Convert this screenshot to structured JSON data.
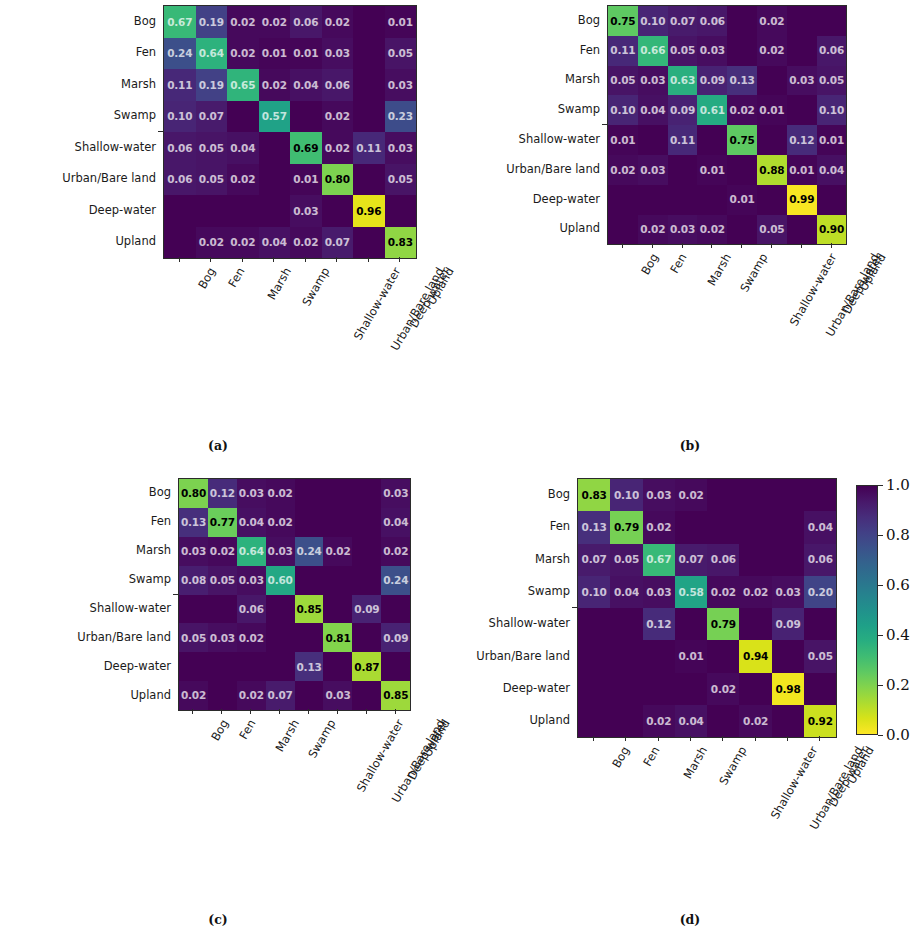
{
  "figure": {
    "classes": [
      "Bog",
      "Fen",
      "Marsh",
      "Swamp",
      "Shallow-water",
      "Urban/Bare land",
      "Deep-water",
      "Upland"
    ],
    "captions": {
      "a": "(a)",
      "b": "(b)",
      "c": "(c)",
      "d": "(d)"
    },
    "colormap": "viridis",
    "colorbar": {
      "vmin": 0.0,
      "vmax": 1.0,
      "ticks": [
        "1.0",
        "0.8",
        "0.6",
        "0.4",
        "0.2",
        "0.0"
      ],
      "tick_values": [
        1.0,
        0.8,
        0.6,
        0.4,
        0.2,
        0.0
      ]
    }
  },
  "chart_data": [
    {
      "type": "heatmap",
      "title": "(a)",
      "xlabel": "",
      "ylabel": "",
      "x_tick_labels": [
        "Bog",
        "Fen",
        "Marsh",
        "Swamp",
        "Shallow-water",
        "Urban/Bare land",
        "Deep-water",
        "Upland"
      ],
      "y_tick_labels": [
        "Bog",
        "Fen",
        "Marsh",
        "Swamp",
        "Shallow-water",
        "Urban/Bare land",
        "Deep-water",
        "Upland"
      ],
      "zlim": [
        0.0,
        1.0
      ],
      "colormap": "viridis",
      "grid": false,
      "legend": "colorbar-right",
      "values": [
        [
          0.67,
          0.19,
          0.02,
          0.02,
          0.06,
          0.02,
          0.0,
          0.01
        ],
        [
          0.24,
          0.64,
          0.02,
          0.01,
          0.01,
          0.03,
          0.0,
          0.05
        ],
        [
          0.11,
          0.19,
          0.65,
          0.02,
          0.04,
          0.06,
          0.0,
          0.03
        ],
        [
          0.1,
          0.07,
          0.0,
          0.57,
          0.0,
          0.02,
          0.0,
          0.23
        ],
        [
          0.06,
          0.05,
          0.04,
          0.0,
          0.69,
          0.02,
          0.11,
          0.03
        ],
        [
          0.06,
          0.05,
          0.02,
          0.0,
          0.01,
          0.8,
          0.0,
          0.05
        ],
        [
          0.0,
          0.0,
          0.0,
          0.0,
          0.03,
          0.0,
          0.96,
          0.0
        ],
        [
          0.0,
          0.02,
          0.02,
          0.04,
          0.02,
          0.07,
          0.0,
          0.83
        ]
      ],
      "labels": [
        [
          "0.67",
          "0.19",
          "0.02",
          "0.02",
          "0.06",
          "0.02",
          "",
          "0.01"
        ],
        [
          "0.24",
          "0.64",
          "0.02",
          "0.01",
          "0.01",
          "0.03",
          "",
          "0.05"
        ],
        [
          "0.11",
          "0.19",
          "0.65",
          "0.02",
          "0.04",
          "0.06",
          "",
          "0.03"
        ],
        [
          "0.10",
          "0.07",
          "",
          "0.57",
          "",
          "0.02",
          "",
          "0.23"
        ],
        [
          "0.06",
          "0.05",
          "0.04",
          "",
          "0.69",
          "0.02",
          "0.11",
          "0.03"
        ],
        [
          "0.06",
          "0.05",
          "0.02",
          "",
          "0.01",
          "0.80",
          "",
          "0.05"
        ],
        [
          "",
          "",
          "",
          "",
          "0.03",
          "",
          "0.96",
          ""
        ],
        [
          "",
          "0.02",
          "0.02",
          "0.04",
          "0.02",
          "0.07",
          "",
          "0.83"
        ]
      ]
    },
    {
      "type": "heatmap",
      "title": "(b)",
      "xlabel": "",
      "ylabel": "",
      "x_tick_labels": [
        "Bog",
        "Fen",
        "Marsh",
        "Swamp",
        "Shallow-water",
        "Urban/Bare land",
        "Deep-water",
        "Upland"
      ],
      "y_tick_labels": [
        "Bog",
        "Fen",
        "Marsh",
        "Swamp",
        "Shallow-water",
        "Urban/Bare land",
        "Deep-water",
        "Upland"
      ],
      "zlim": [
        0.0,
        1.0
      ],
      "colormap": "viridis",
      "grid": false,
      "legend": "colorbar-right",
      "values": [
        [
          0.75,
          0.1,
          0.07,
          0.06,
          0.0,
          0.02,
          0.0,
          0.0
        ],
        [
          0.11,
          0.66,
          0.05,
          0.03,
          0.0,
          0.02,
          0.0,
          0.06
        ],
        [
          0.05,
          0.03,
          0.63,
          0.09,
          0.13,
          0.0,
          0.03,
          0.05
        ],
        [
          0.1,
          0.04,
          0.09,
          0.61,
          0.02,
          0.01,
          0.0,
          0.1
        ],
        [
          0.01,
          0.0,
          0.11,
          0.0,
          0.75,
          0.0,
          0.12,
          0.01
        ],
        [
          0.02,
          0.03,
          0.0,
          0.01,
          0.0,
          0.88,
          0.01,
          0.04
        ],
        [
          0.0,
          0.0,
          0.0,
          0.0,
          0.01,
          0.0,
          0.99,
          0.0
        ],
        [
          0.0,
          0.02,
          0.03,
          0.02,
          0.0,
          0.05,
          0.0,
          0.9
        ]
      ],
      "labels": [
        [
          "0.75",
          "0.10",
          "0.07",
          "0.06",
          "",
          "0.02",
          "",
          ""
        ],
        [
          "0.11",
          "0.66",
          "0.05",
          "0.03",
          "",
          "0.02",
          "",
          "0.06"
        ],
        [
          "0.05",
          "0.03",
          "0.63",
          "0.09",
          "0.13",
          "",
          "0.03",
          "0.05"
        ],
        [
          "0.10",
          "0.04",
          "0.09",
          "0.61",
          "0.02",
          "0.01",
          "",
          "0.10"
        ],
        [
          "0.01",
          "",
          "0.11",
          "",
          "0.75",
          "",
          "0.12",
          "0.01"
        ],
        [
          "0.02",
          "0.03",
          "",
          "0.01",
          "",
          "0.88",
          "0.01",
          "0.04"
        ],
        [
          "",
          "",
          "",
          "",
          "0.01",
          "",
          "0.99",
          ""
        ],
        [
          "",
          "0.02",
          "0.03",
          "0.02",
          "",
          "0.05",
          "",
          "0.90"
        ]
      ]
    },
    {
      "type": "heatmap",
      "title": "(c)",
      "xlabel": "",
      "ylabel": "",
      "x_tick_labels": [
        "Bog",
        "Fen",
        "Marsh",
        "Swamp",
        "Shallow-water",
        "Urban/Bare land",
        "Deep-water",
        "Upland"
      ],
      "y_tick_labels": [
        "Bog",
        "Fen",
        "Marsh",
        "Swamp",
        "Shallow-water",
        "Urban/Bare land",
        "Deep-water",
        "Upland"
      ],
      "zlim": [
        0.0,
        1.0
      ],
      "colormap": "viridis",
      "grid": false,
      "legend": "colorbar-right",
      "values": [
        [
          0.8,
          0.12,
          0.03,
          0.02,
          0.0,
          0.0,
          0.0,
          0.03
        ],
        [
          0.13,
          0.77,
          0.04,
          0.02,
          0.0,
          0.0,
          0.0,
          0.04
        ],
        [
          0.03,
          0.02,
          0.64,
          0.03,
          0.24,
          0.02,
          0.0,
          0.02
        ],
        [
          0.08,
          0.05,
          0.03,
          0.6,
          0.0,
          0.0,
          0.0,
          0.24
        ],
        [
          0.0,
          0.0,
          0.06,
          0.0,
          0.85,
          0.0,
          0.09,
          0.0
        ],
        [
          0.05,
          0.03,
          0.02,
          0.0,
          0.0,
          0.81,
          0.0,
          0.09
        ],
        [
          0.0,
          0.0,
          0.0,
          0.0,
          0.13,
          0.0,
          0.87,
          0.0
        ],
        [
          0.02,
          0.0,
          0.02,
          0.07,
          0.0,
          0.03,
          0.0,
          0.85
        ]
      ],
      "labels": [
        [
          "0.80",
          "0.12",
          "0.03",
          "0.02",
          "",
          "",
          "",
          "0.03"
        ],
        [
          "0.13",
          "0.77",
          "0.04",
          "0.02",
          "",
          "",
          "",
          "0.04"
        ],
        [
          "0.03",
          "0.02",
          "0.64",
          "0.03",
          "0.24",
          "0.02",
          "",
          "0.02"
        ],
        [
          "0.08",
          "0.05",
          "0.03",
          "0.60",
          "",
          "",
          "",
          "0.24"
        ],
        [
          "",
          "",
          "0.06",
          "",
          "0.85",
          "",
          "0.09",
          ""
        ],
        [
          "0.05",
          "0.03",
          "0.02",
          "",
          "",
          "0.81",
          "",
          "0.09"
        ],
        [
          "",
          "",
          "",
          "",
          "0.13",
          "",
          "0.87",
          ""
        ],
        [
          "0.02",
          "",
          "0.02",
          "0.07",
          "",
          "0.03",
          "",
          "0.85"
        ]
      ]
    },
    {
      "type": "heatmap",
      "title": "(d)",
      "xlabel": "",
      "ylabel": "",
      "x_tick_labels": [
        "Bog",
        "Fen",
        "Marsh",
        "Swamp",
        "Shallow-water",
        "Urban/Bare land",
        "Deep-water",
        "Upland"
      ],
      "y_tick_labels": [
        "Bog",
        "Fen",
        "Marsh",
        "Swamp",
        "Shallow-water",
        "Urban/Bare land",
        "Deep-water",
        "Upland"
      ],
      "zlim": [
        0.0,
        1.0
      ],
      "colormap": "viridis",
      "grid": false,
      "legend": "colorbar-right",
      "values": [
        [
          0.83,
          0.1,
          0.03,
          0.02,
          0.0,
          0.0,
          0.0,
          0.0
        ],
        [
          0.13,
          0.79,
          0.02,
          0.0,
          0.0,
          0.0,
          0.0,
          0.04
        ],
        [
          0.07,
          0.05,
          0.67,
          0.07,
          0.06,
          0.0,
          0.0,
          0.06
        ],
        [
          0.1,
          0.04,
          0.03,
          0.58,
          0.02,
          0.02,
          0.03,
          0.2
        ],
        [
          0.0,
          0.0,
          0.12,
          0.0,
          0.79,
          0.0,
          0.09,
          0.0
        ],
        [
          0.0,
          0.0,
          0.0,
          0.01,
          0.0,
          0.94,
          0.0,
          0.05
        ],
        [
          0.0,
          0.0,
          0.0,
          0.0,
          0.02,
          0.0,
          0.98,
          0.0
        ],
        [
          0.0,
          0.0,
          0.02,
          0.04,
          0.0,
          0.02,
          0.0,
          0.92
        ]
      ],
      "labels": [
        [
          "0.83",
          "0.10",
          "0.03",
          "0.02",
          "",
          "",
          "",
          ""
        ],
        [
          "0.13",
          "0.79",
          "0.02",
          "",
          "",
          "",
          "",
          "0.04"
        ],
        [
          "0.07",
          "0.05",
          "0.67",
          "0.07",
          "0.06",
          "",
          "",
          "0.06"
        ],
        [
          "0.10",
          "0.04",
          "0.03",
          "0.58",
          "0.02",
          "0.02",
          "0.03",
          "0.20"
        ],
        [
          "",
          "",
          "0.12",
          "",
          "0.79",
          "",
          "0.09",
          ""
        ],
        [
          "",
          "",
          "",
          "0.01",
          "",
          "0.94",
          "",
          "0.05"
        ],
        [
          "",
          "",
          "",
          "",
          "0.02",
          "",
          "0.98",
          ""
        ],
        [
          "",
          "",
          "0.02",
          "0.04",
          "",
          "0.02",
          "",
          "0.92"
        ]
      ]
    }
  ]
}
